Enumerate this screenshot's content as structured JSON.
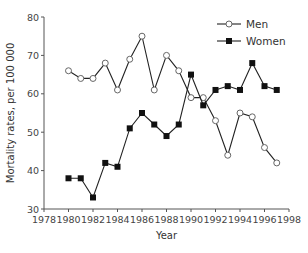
{
  "chart_data": {
    "type": "line",
    "title": "",
    "xlabel": "Year",
    "ylabel": "Mortality rates, per 100 000",
    "xlim": [
      1978,
      1998
    ],
    "ylim": [
      30,
      80
    ],
    "xticks": [
      1978,
      1980,
      1982,
      1984,
      1986,
      1988,
      1990,
      1992,
      1994,
      1996,
      1998
    ],
    "yticks": [
      30,
      40,
      50,
      60,
      70,
      80
    ],
    "grid": false,
    "legend_position": "top-right",
    "x": [
      1980,
      1981,
      1982,
      1983,
      1984,
      1985,
      1986,
      1987,
      1988,
      1989,
      1990,
      1991,
      1992,
      1993,
      1994,
      1995,
      1996,
      1997
    ],
    "series": [
      {
        "name": "Men",
        "marker": "open-circle",
        "values": [
          66,
          64,
          64,
          68,
          61,
          69,
          75,
          61,
          70,
          66,
          59,
          59,
          53,
          44,
          55,
          54,
          46,
          42
        ]
      },
      {
        "name": "Women",
        "marker": "filled-square",
        "values": [
          38,
          38,
          33,
          42,
          41,
          51,
          55,
          52,
          49,
          52,
          65,
          57,
          61,
          62,
          61,
          68,
          62,
          61
        ]
      }
    ]
  },
  "colors": {
    "line": "#222222",
    "axis": "#555555",
    "circle_fill": "#ffffff",
    "circle_stroke": "#666666",
    "square_fill": "#111111"
  }
}
